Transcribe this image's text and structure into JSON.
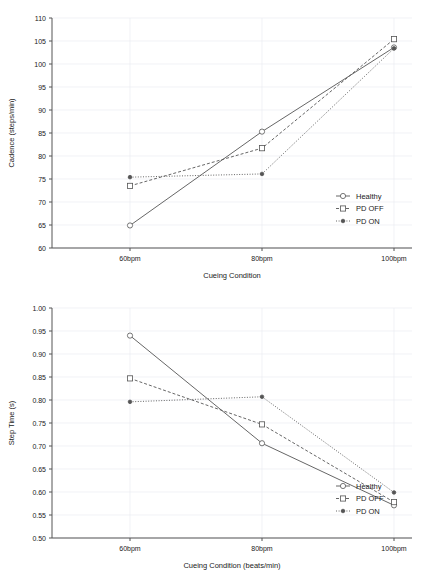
{
  "figure": {
    "panels": [
      "cadence-panel",
      "steptime-panel"
    ]
  },
  "chart_data": [
    {
      "id": "cadence",
      "type": "line",
      "title": "",
      "xlabel": "Cueing Condition",
      "ylabel": "Cadence (steps/min)",
      "categories": [
        "60bpm",
        "80bpm",
        "100bpm"
      ],
      "ylim": [
        60,
        110
      ],
      "yticks": [
        60,
        65,
        70,
        75,
        80,
        85,
        90,
        95,
        100,
        105,
        110
      ],
      "ytick_labels": [
        "60",
        "65",
        "70",
        "75",
        "80",
        "85",
        "90",
        "95",
        "100",
        "105",
        "110"
      ],
      "grid": true,
      "legend_position": "right-inside-lower",
      "series": [
        {
          "name": "Healthy",
          "values": [
            64.9,
            85.3,
            103.6
          ],
          "marker": "open-circle",
          "linestyle": "solid",
          "color": "#555555"
        },
        {
          "name": "PD OFF",
          "values": [
            73.5,
            81.7,
            105.4
          ],
          "marker": "open-square",
          "linestyle": "dashed",
          "color": "#555555"
        },
        {
          "name": "PD ON",
          "values": [
            75.4,
            76.1,
            103.4
          ],
          "marker": "filled-diamond",
          "linestyle": "dotted",
          "color": "#555555"
        }
      ]
    },
    {
      "id": "steptime",
      "type": "line",
      "title": "",
      "xlabel": "Cueing Condition (beats/min)",
      "ylabel": "Step Time (s)",
      "categories": [
        "60bpm",
        "80bpm",
        "100bpm"
      ],
      "ylim": [
        0.5,
        1.0
      ],
      "yticks": [
        0.5,
        0.55,
        0.6,
        0.65,
        0.7,
        0.75,
        0.8,
        0.85,
        0.9,
        0.95,
        1.0
      ],
      "ytick_labels": [
        "0.50",
        "0.55",
        "0.60",
        "0.65",
        "0.70",
        "0.75",
        "0.80",
        "0.85",
        "0.90",
        "0.95",
        "1.00"
      ],
      "grid": true,
      "legend_position": "right-inside-lower",
      "series": [
        {
          "name": "Healthy",
          "values": [
            0.94,
            0.706,
            0.571
          ],
          "marker": "open-circle",
          "linestyle": "solid",
          "color": "#555555"
        },
        {
          "name": "PD OFF",
          "values": [
            0.847,
            0.747,
            0.578
          ],
          "marker": "open-square",
          "linestyle": "dashed",
          "color": "#555555"
        },
        {
          "name": "PD ON",
          "values": [
            0.796,
            0.807,
            0.599
          ],
          "marker": "filled-diamond",
          "linestyle": "dotted",
          "color": "#555555"
        }
      ]
    }
  ],
  "style": {
    "line_color": "#555555",
    "grid_color": "#e8eaf0",
    "axis_color": "#555555",
    "background": "#ffffff"
  }
}
